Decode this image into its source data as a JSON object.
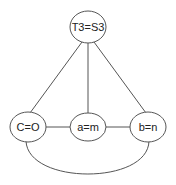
{
  "diagram": {
    "nodes": [
      {
        "id": "top",
        "label": "T3=S3",
        "cx": 88,
        "cy": 27,
        "rx": 18,
        "ry": 16
      },
      {
        "id": "left",
        "label": "C=O",
        "cx": 28,
        "cy": 127,
        "rx": 18,
        "ry": 15
      },
      {
        "id": "middle",
        "label": "a=m",
        "cx": 88,
        "cy": 127,
        "rx": 18,
        "ry": 14
      },
      {
        "id": "right",
        "label": "b=n",
        "cx": 148,
        "cy": 127,
        "rx": 18,
        "ry": 15
      }
    ],
    "edges": [
      {
        "from": "top",
        "to": "left"
      },
      {
        "from": "top",
        "to": "middle"
      },
      {
        "from": "top",
        "to": "right"
      },
      {
        "from": "left",
        "to": "middle"
      },
      {
        "from": "middle",
        "to": "right"
      },
      {
        "from": "left",
        "to": "right",
        "style": "arc-below"
      }
    ],
    "colors": {
      "stroke": "#555555",
      "text": "#222222",
      "background": "#ffffff"
    }
  }
}
